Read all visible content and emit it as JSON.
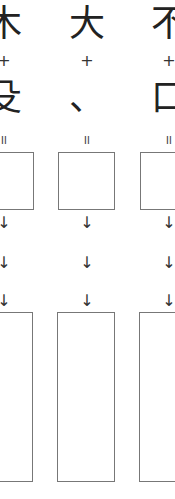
{
  "worksheet": {
    "columns": [
      {
        "top_char": "木",
        "operator": "+",
        "bottom_char": "殳",
        "equals": "=",
        "arrows": [
          "↓",
          "↓",
          "↓"
        ]
      },
      {
        "top_char": "大",
        "operator": "+",
        "bottom_char": "、",
        "equals": "=",
        "arrows": [
          "↓",
          "↓",
          "↓"
        ]
      },
      {
        "top_char": "不",
        "operator": "+",
        "bottom_char": "口",
        "equals": "=",
        "arrows": [
          "↓",
          "↓",
          "↓"
        ]
      }
    ]
  }
}
